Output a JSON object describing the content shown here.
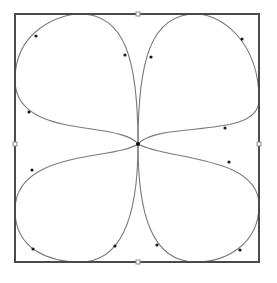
{
  "diagram": {
    "type": "four-petal curve (quatrefoil) inside a square frame",
    "colors": {
      "frame": "#4a4a4a",
      "curve": "#7a7a7a",
      "points": "#1a1a1a",
      "background": "#ffffff"
    },
    "frame": {
      "x": 15,
      "y": 14,
      "width": 244,
      "height": 248
    },
    "center": {
      "x": 138,
      "y": 144
    },
    "edge_ticks": [
      {
        "side": "top",
        "x": 138,
        "y": 14
      },
      {
        "side": "bottom",
        "x": 138,
        "y": 262
      },
      {
        "side": "left",
        "x": 15,
        "y": 144
      },
      {
        "side": "right",
        "x": 259,
        "y": 144
      }
    ],
    "petals": [
      {
        "name": "top-left",
        "path": "M138,144 C120,120 15,140 15,80 C15,30 60,14 80,14 C125,14 138,60 138,144",
        "points": [
          [
            36,
            36
          ],
          [
            125,
            55
          ],
          [
            29,
            112
          ]
        ]
      },
      {
        "name": "top-right",
        "path": "M138,144 C138,60 151,14 196,14 C220,14 259,40 259,100 C259,140 160,120 138,144",
        "points": [
          [
            151,
            57
          ],
          [
            242,
            39
          ],
          [
            225,
            128
          ]
        ]
      },
      {
        "name": "bottom-left",
        "path": "M138,144 C115,160 15,150 15,210 C15,250 50,262 80,262 C125,262 138,210 138,144",
        "points": [
          [
            32,
            170
          ],
          [
            33,
            249
          ],
          [
            115,
            246
          ]
        ]
      },
      {
        "name": "bottom-right",
        "path": "M138,144 C138,210 150,262 196,262 C225,262 259,245 259,205 C259,155 165,160 138,144",
        "points": [
          [
            229,
            162
          ],
          [
            157,
            245
          ],
          [
            240,
            250
          ]
        ]
      }
    ]
  }
}
